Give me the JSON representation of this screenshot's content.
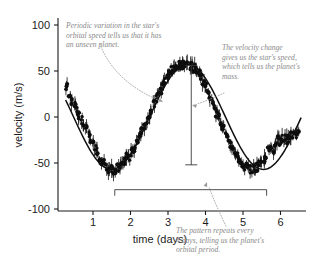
{
  "chart_data": {
    "type": "scatter",
    "title": "",
    "xlabel": "time (days)",
    "ylabel": "velocity (m/s)",
    "xlim": [
      0.25,
      6.6
    ],
    "ylim": [
      -100,
      115
    ],
    "xticks": [
      1,
      2,
      3,
      4,
      5,
      6
    ],
    "xtick_labels": [
      "1",
      "2",
      "3",
      "4",
      "5",
      "6"
    ],
    "yticks": [
      100,
      50,
      0,
      -50,
      -100
    ],
    "ytick_labels": [
      "100",
      "50",
      "0",
      "-50",
      "-100"
    ],
    "grid": false,
    "legend": "none",
    "series": [
      {
        "name": "stellar radial velocity",
        "model": "sinusoid",
        "amplitude": 57,
        "period_days": 4.05,
        "phase_peak_day": 3.52,
        "offset": 0,
        "x": [
          0.3,
          0.38,
          0.45,
          0.52,
          0.58,
          0.64,
          0.7,
          0.76,
          0.82,
          0.88,
          0.94,
          1.0,
          1.06,
          1.12,
          1.18,
          1.24,
          1.3,
          1.36,
          1.42,
          1.48,
          1.54,
          1.6,
          1.66,
          1.72,
          1.78,
          1.84,
          1.9,
          1.96,
          2.02,
          2.08,
          2.14,
          2.2,
          2.26,
          2.32,
          2.38,
          2.44,
          2.5,
          2.56,
          2.62,
          2.68,
          2.74,
          2.8,
          2.86,
          2.92,
          2.98,
          3.04,
          3.1,
          3.16,
          3.22,
          3.28,
          3.34,
          3.4,
          3.46,
          3.52,
          3.58,
          3.64,
          3.7,
          3.76,
          3.82,
          3.88,
          3.94,
          4.0,
          4.06,
          4.12,
          4.18,
          4.24,
          4.3,
          4.36,
          4.42,
          4.48,
          4.54,
          4.6,
          4.66,
          4.72,
          4.78,
          4.84,
          4.9,
          4.96,
          5.02,
          5.08,
          5.14,
          5.2,
          5.26,
          5.32,
          5.38,
          5.44,
          5.5,
          5.56,
          5.62,
          5.68,
          5.74,
          5.8,
          5.86,
          5.92,
          5.98,
          6.04,
          6.1,
          6.16,
          6.22,
          6.28,
          6.34,
          6.4,
          6.46
        ],
        "y": [
          33,
          24,
          17,
          12,
          6,
          1,
          -4,
          -9,
          -13,
          -18,
          -23,
          -26,
          -33,
          -38,
          -43,
          -47,
          -50,
          -54,
          -56,
          -57,
          -58,
          -57,
          -55,
          -53,
          -51,
          -48,
          -44,
          -43,
          -38,
          -34,
          -30,
          -25,
          -20,
          -15,
          -10,
          -4,
          2,
          8,
          14,
          19,
          25,
          30,
          35,
          40,
          44,
          48,
          51,
          54,
          56,
          57,
          57,
          56,
          56,
          57,
          55,
          55,
          53,
          50,
          47,
          43,
          39,
          34,
          28,
          23,
          17,
          11,
          5,
          -1,
          -7,
          -12,
          -18,
          -24,
          -29,
          -34,
          -39,
          -43,
          -47,
          -50,
          -53,
          -55,
          -56,
          -57,
          -57,
          -56,
          -54,
          -52,
          -49,
          -45,
          -41,
          -36,
          -31,
          -35,
          -30,
          -25,
          -27,
          -24,
          -22,
          -25,
          -23,
          -21,
          -20,
          -19,
          -18
        ],
        "error_bar_typical": 5
      }
    ],
    "measurements": [
      {
        "name": "velocity-amplitude-bar",
        "kind": "vertical-double-ended",
        "x_day": 3.62,
        "y_top": 56,
        "y_bottom": -52
      },
      {
        "name": "orbital-period-bar",
        "kind": "horizontal-double-ended",
        "y_value": -79,
        "x_start_day": 1.58,
        "x_end_day": 5.63,
        "span_days": 4
      }
    ],
    "annotations": [
      {
        "id": "periodic-variation-note",
        "lines": [
          "Periodic variation in the star's",
          "orbital speed tells us that it has",
          "an unseen planet."
        ],
        "text_x": 66,
        "text_y": 28,
        "leader": {
          "path": "M 100,44 C 108,66 126,86 158,100",
          "arrow_x": 163,
          "arrow_y": 102,
          "arrow_angle": 28
        }
      },
      {
        "id": "velocity-change-note",
        "lines": [
          "The velocity change",
          "gives us the star's speed,",
          "which tells us the planet's",
          "mass."
        ],
        "text_x": 222,
        "text_y": 50,
        "leader": {
          "path": "M 224,93 C 216,97 206,101 197,104",
          "arrow_x": 192,
          "arrow_y": 105,
          "arrow_angle": 195
        }
      },
      {
        "id": "orbital-period-note",
        "lines": [
          "The pattern repeats every",
          "4 days, telling us the planet's",
          "orbital period."
        ],
        "text_x": 176,
        "text_y": 233,
        "leader": {
          "path": "M 226,226 C 220,214 213,198 209,187",
          "arrow_x": 207,
          "arrow_y": 182,
          "arrow_angle": 290
        }
      }
    ],
    "colors": {
      "axis": "#1b1b1b",
      "data": "#0d0d0d",
      "annotation_text": "#8a8a8a",
      "leader_line": "#9a9a9a",
      "measure_bar": "#3a3a3a",
      "background": "#ffffff"
    }
  }
}
